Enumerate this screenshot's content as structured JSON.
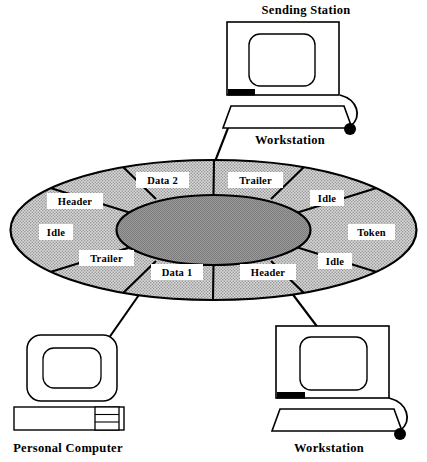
{
  "diagram": {
    "type": "token-ring-topology"
  },
  "ring": {
    "hub_fill": "#8d8d8d",
    "band_fill": "#c9c9c9",
    "stroke": "#000000",
    "segments": [
      {
        "id": "data-2",
        "label": "Data 2",
        "position": "top-left"
      },
      {
        "id": "trailer-top",
        "label": "Trailer",
        "position": "top-center-right"
      },
      {
        "id": "idle-upper-right",
        "label": "Idle",
        "position": "upper-right"
      },
      {
        "id": "token",
        "label": "Token",
        "position": "right"
      },
      {
        "id": "idle-lower-right",
        "label": "Idle",
        "position": "lower-right"
      },
      {
        "id": "header-bottom",
        "label": "Header",
        "position": "bottom-right"
      },
      {
        "id": "data-1",
        "label": "Data 1",
        "position": "bottom-left"
      },
      {
        "id": "trailer-left",
        "label": "Trailer",
        "position": "lower-left"
      },
      {
        "id": "idle-left",
        "label": "Idle",
        "position": "left"
      },
      {
        "id": "header-top",
        "label": "Header",
        "position": "upper-left"
      }
    ]
  },
  "nodes": {
    "sending_station": {
      "title": "Sending Station",
      "device_label": "Workstation",
      "device_type": "workstation-monitor-keyboard-mouse"
    },
    "personal_computer": {
      "label": "Personal Computer",
      "device_type": "desktop-pc-with-base-unit"
    },
    "workstation_bottom": {
      "label": "Workstation",
      "device_type": "workstation-monitor-keyboard-mouse"
    }
  }
}
